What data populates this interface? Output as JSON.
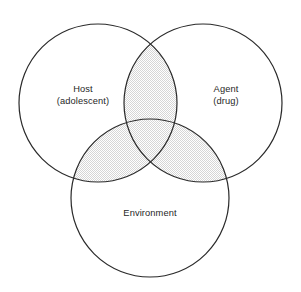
{
  "figure": {
    "name": "epidemiologic-triad-venn",
    "background_color": "#ffffff",
    "width": 301,
    "height": 292
  },
  "diagram": {
    "type": "venn-3-circle",
    "stroke_color": "#2a2a2a",
    "stroke_width": 1.2,
    "circle_fill": "#ffffff",
    "overlap_fill_pattern": "stipple-checkerboard",
    "overlap_fill_color": "#d6d6d6",
    "circles": [
      {
        "id": "host",
        "label_line1": "Host",
        "label_line2": "(adolescent)",
        "cx": 98,
        "cy": 103,
        "r": 79,
        "label_x": 83,
        "label_y": 92
      },
      {
        "id": "agent",
        "label_line1": "Agent",
        "label_line2": "(drug)",
        "cx": 203,
        "cy": 103,
        "r": 79,
        "label_x": 226,
        "label_y": 92
      },
      {
        "id": "environment",
        "label_line1": "Environment",
        "label_line2": "",
        "cx": 150,
        "cy": 198,
        "r": 79,
        "label_x": 150,
        "label_y": 216
      }
    ],
    "overlap_regions": [
      {
        "id": "host-agent",
        "shaded": true
      },
      {
        "id": "host-environment",
        "shaded": true
      },
      {
        "id": "agent-environment",
        "shaded": true
      },
      {
        "id": "host-agent-environment",
        "shaded": true
      }
    ]
  }
}
